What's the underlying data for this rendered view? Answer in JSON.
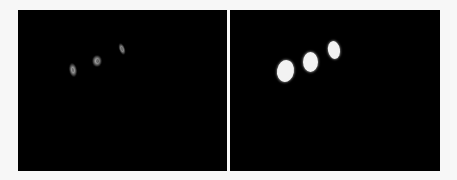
{
  "figure": {
    "background": "#f7f7f7",
    "panels": [
      {
        "id": "left",
        "label": "raw-detection",
        "background": "#000000",
        "box": {
          "x": 18,
          "y": 10,
          "w": 209,
          "h": 161
        },
        "blobs": [
          {
            "cx": 73,
            "cy": 70,
            "w": 8,
            "h": 14,
            "rot": -10
          },
          {
            "cx": 97,
            "cy": 61,
            "w": 10,
            "h": 12,
            "rot": 0
          },
          {
            "cx": 122,
            "cy": 49,
            "w": 6,
            "h": 12,
            "rot": -20
          }
        ]
      },
      {
        "id": "right",
        "label": "segmentation-mask",
        "background": "#000000",
        "box": {
          "x": 230,
          "y": 10,
          "w": 210,
          "h": 161
        },
        "blobs": [
          {
            "cx": 285,
            "cy": 71,
            "w": 17,
            "h": 22,
            "rot": 10
          },
          {
            "cx": 310,
            "cy": 62,
            "w": 15,
            "h": 20,
            "rot": 0
          },
          {
            "cx": 334,
            "cy": 50,
            "w": 12,
            "h": 18,
            "rot": -10
          }
        ]
      }
    ]
  }
}
